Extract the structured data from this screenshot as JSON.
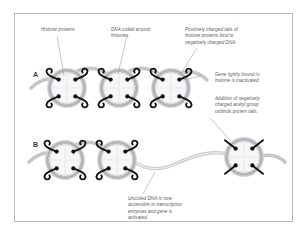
{
  "figure": {
    "background_color": "#ffffff",
    "border_color": "#b9b9bd",
    "text_color": "#59595d",
    "dna_color": "#b0b0b4",
    "dna_highlight_color": "#d8d8dc",
    "tail_color": "#1a1a1a",
    "core_fill": "#f6f6f8",
    "leader_color": "#9a9a9e"
  },
  "panels": [
    {
      "letter": "A",
      "name": "condensed-chromatin-panel",
      "state": "Gene tightly bound to histone is inactivated",
      "nucleosome_count": 3,
      "tails_bound": true
    },
    {
      "letter": "B",
      "name": "acetylated-chromatin-panel",
      "state": "Uncoiled DNA is now accessible to transcription enzymes and gene is activated",
      "nucleosome_count": 3,
      "tails_bound": false
    }
  ],
  "captions": {
    "histone_proteins": "Histone proteins",
    "dna_coiled": "DNA coiled around\nhistones",
    "positive_tails": "Positively charged tails of\nhistone proteins bind to\nnegatively charged DNA.",
    "gene_inactive": "Gene tightly bound to\nhistone is inactivated",
    "acetyl_unbinds": "Addition of negatively\ncharged acetyl group\nunbinds protein tails.",
    "uncoiled_dna": "Uncoiled DNA is now\naccessible to transcription\nenzymes and gene is\nactivated."
  },
  "letters": {
    "a": "A",
    "b": "B"
  }
}
